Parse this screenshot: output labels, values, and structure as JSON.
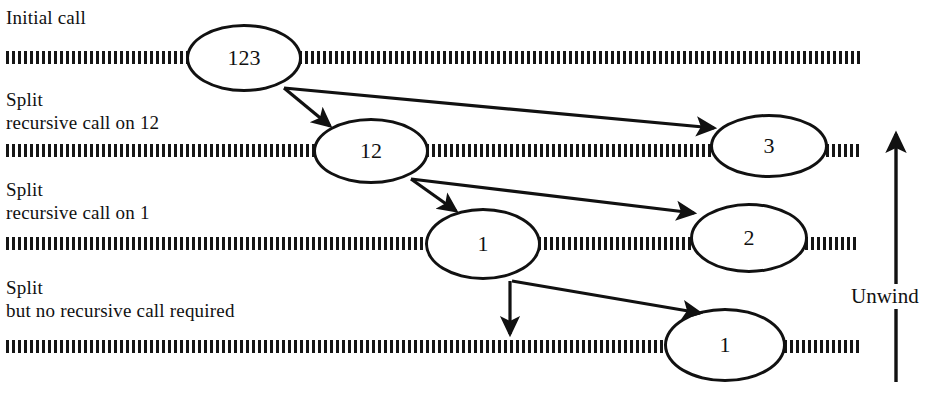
{
  "diagram": {
    "stages": [
      {
        "id": "stage-initial",
        "lines": [
          "Initial call"
        ],
        "x": 6,
        "y": 6
      },
      {
        "id": "stage-split-12",
        "lines": [
          "Split",
          "recursive call on 12"
        ],
        "x": 6,
        "y": 88
      },
      {
        "id": "stage-split-1",
        "lines": [
          "Split",
          "recursive call on 1"
        ],
        "x": 6,
        "y": 178
      },
      {
        "id": "stage-split-none",
        "lines": [
          "Split",
          "but no recursive call required"
        ],
        "x": 6,
        "y": 276
      }
    ],
    "nodes": [
      {
        "id": "node-123",
        "label": "123",
        "x": 186,
        "y": 24,
        "w": 116,
        "h": 68
      },
      {
        "id": "node-12",
        "label": "12",
        "x": 313,
        "y": 118,
        "w": 116,
        "h": 66
      },
      {
        "id": "node-3",
        "label": "3",
        "x": 710,
        "y": 114,
        "w": 118,
        "h": 64
      },
      {
        "id": "node-1-row3",
        "label": "1",
        "x": 425,
        "y": 208,
        "w": 116,
        "h": 72
      },
      {
        "id": "node-2",
        "label": "2",
        "x": 690,
        "y": 203,
        "w": 118,
        "h": 70
      },
      {
        "id": "node-1-row4",
        "label": "1",
        "x": 664,
        "y": 308,
        "w": 122,
        "h": 74
      }
    ],
    "hatched_bands": [
      {
        "id": "band-row1-left",
        "x": 6,
        "y": 51,
        "w": 183
      },
      {
        "id": "band-row1-right",
        "x": 299,
        "y": 51,
        "w": 561
      },
      {
        "id": "band-row2-left",
        "x": 6,
        "y": 144,
        "w": 309
      },
      {
        "id": "band-row2-mid",
        "x": 426,
        "y": 144,
        "w": 286
      },
      {
        "id": "band-row2-right",
        "x": 826,
        "y": 144,
        "w": 33
      },
      {
        "id": "band-row3-left",
        "x": 6,
        "y": 237,
        "w": 421
      },
      {
        "id": "band-row3-mid",
        "x": 538,
        "y": 237,
        "w": 154
      },
      {
        "id": "band-row3-right",
        "x": 805,
        "y": 237,
        "w": 54
      },
      {
        "id": "band-row4-left",
        "x": 6,
        "y": 340,
        "w": 660
      },
      {
        "id": "band-row4-right",
        "x": 784,
        "y": 340,
        "w": 76
      }
    ],
    "arrows": [
      {
        "id": "arrow-123-to-12",
        "x1": 284,
        "y1": 88,
        "x2": 330,
        "y2": 126
      },
      {
        "id": "arrow-123-to-3",
        "x1": 284,
        "y1": 88,
        "x2": 714,
        "y2": 128
      },
      {
        "id": "arrow-12-to-1",
        "x1": 411,
        "y1": 179,
        "x2": 456,
        "y2": 211
      },
      {
        "id": "arrow-12-to-2",
        "x1": 411,
        "y1": 179,
        "x2": 694,
        "y2": 213
      },
      {
        "id": "arrow-1-down",
        "x1": 510,
        "y1": 281,
        "x2": 510,
        "y2": 334
      },
      {
        "id": "arrow-1-to-1",
        "x1": 512,
        "y1": 281,
        "x2": 700,
        "y2": 313
      }
    ],
    "unwind": {
      "label": "Unwind",
      "label_x": 849,
      "label_y": 284,
      "arrow": {
        "x": 896,
        "y_top": 134,
        "y_bottom": 382
      }
    },
    "colors": {
      "ink": "#111111",
      "hatch": "#151515",
      "background": "#ffffff"
    }
  }
}
